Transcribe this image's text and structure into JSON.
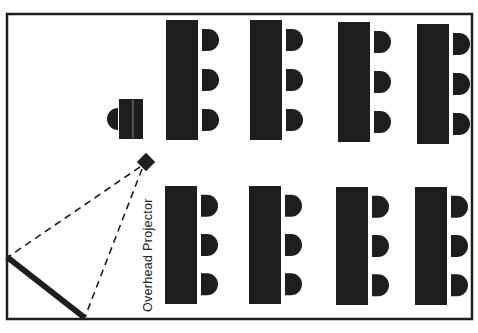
{
  "diagram": {
    "type": "classroom-seating-layout",
    "label": "Overhead Projector",
    "colors": {
      "ink": "#1e1e1e",
      "background": "#ffffff"
    },
    "room": {
      "x": 7,
      "y": 14,
      "w": 465,
      "h": 305
    },
    "tables_top": [
      {
        "x": 166,
        "y": 20,
        "w": 32,
        "h": 120
      },
      {
        "x": 250,
        "y": 20,
        "w": 32,
        "h": 120
      },
      {
        "x": 338,
        "y": 22,
        "w": 32,
        "h": 120
      },
      {
        "x": 417,
        "y": 24,
        "w": 32,
        "h": 120
      }
    ],
    "tables_bottom": [
      {
        "x": 165,
        "y": 186,
        "w": 32,
        "h": 118
      },
      {
        "x": 249,
        "y": 186,
        "w": 32,
        "h": 118
      },
      {
        "x": 336,
        "y": 187,
        "w": 32,
        "h": 118
      },
      {
        "x": 415,
        "y": 187,
        "w": 32,
        "h": 118
      }
    ],
    "chairs_per_table": 3,
    "instructor_desk": {
      "x": 119,
      "y": 99,
      "w": 24,
      "h": 40
    },
    "instructor_chair": {
      "cx": 119,
      "cy": 119,
      "r": 11
    },
    "projector": {
      "cx": 146,
      "cy": 162,
      "size": 13
    },
    "screen": {
      "x1": 7,
      "y1": 257,
      "x2": 85,
      "y2": 318
    }
  }
}
